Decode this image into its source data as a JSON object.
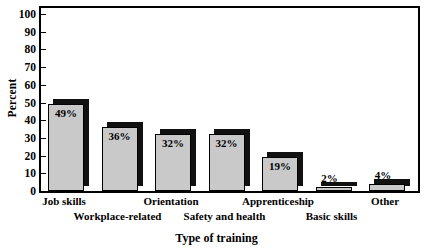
{
  "chart_data": {
    "type": "bar",
    "title": "",
    "xlabel": "Type of training",
    "ylabel": "Percent",
    "ylim": [
      0,
      100
    ],
    "ytick_step": 10,
    "grid": false,
    "legend": "none",
    "style": "3d-grayscale-bars",
    "categories": [
      "Job skills",
      "Workplace-related",
      "Orientation",
      "Safety and health",
      "Apprenticeship",
      "Basic skills",
      "Other"
    ],
    "values": [
      49,
      36,
      32,
      32,
      19,
      2,
      4
    ],
    "value_labels": [
      "49%",
      "36%",
      "32%",
      "32%",
      "19%",
      "2%",
      "4%"
    ],
    "ytick_labels": [
      "0",
      "10",
      "20",
      "30",
      "40",
      "50",
      "60",
      "70",
      "80",
      "90",
      "100"
    ],
    "category_label_rows": [
      0,
      1,
      0,
      1,
      0,
      1,
      0
    ]
  },
  "colors": {
    "bar_face": "#c9c9c9",
    "bar_side": "#111111",
    "outline": "#000000",
    "background": "#ffffff",
    "text": "#000000"
  }
}
